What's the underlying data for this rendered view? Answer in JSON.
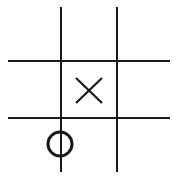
{
  "board": {
    "size": 3,
    "line_color": "#1a1a1a",
    "cells": [
      [
        "",
        "",
        ""
      ],
      [
        "",
        "X",
        ""
      ],
      [
        "O",
        "",
        ""
      ]
    ]
  }
}
